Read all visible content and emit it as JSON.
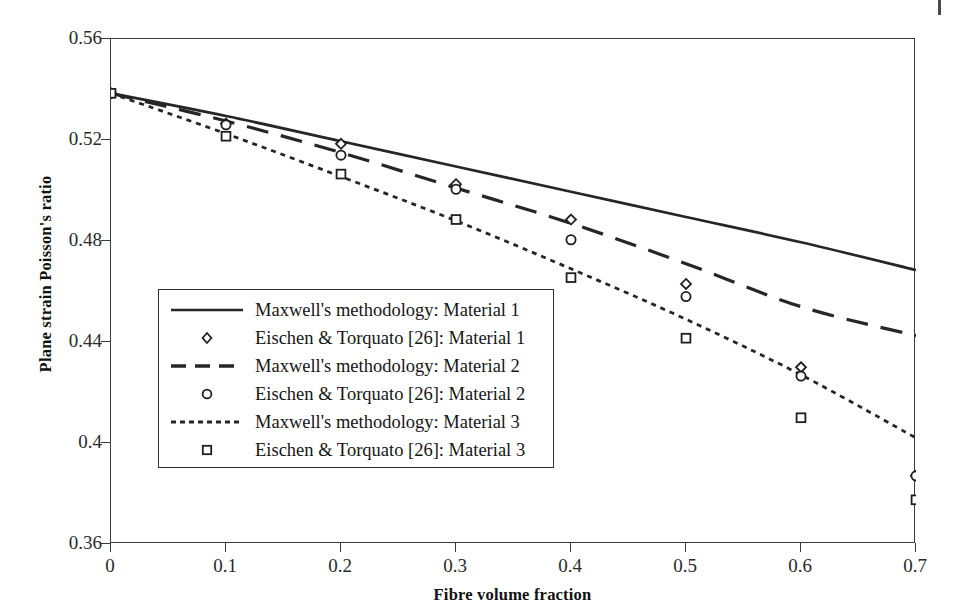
{
  "chart_data": {
    "type": "line",
    "title": "",
    "xlabel": "Fibre volume fraction",
    "ylabel": "Plane strain Poisson's ratio",
    "xlim": [
      0,
      0.7
    ],
    "ylim": [
      0.36,
      0.56
    ],
    "xticks": [
      "0",
      "0.1",
      "0.2",
      "0.3",
      "0.4",
      "0.5",
      "0.6",
      "0.7"
    ],
    "xtick_values": [
      0,
      0.1,
      0.2,
      0.3,
      0.4,
      0.5,
      0.6,
      0.7
    ],
    "yticks": [
      "0.56",
      "0.52",
      "0.48",
      "0.44",
      "0.4",
      "0.36"
    ],
    "ytick_values": [
      0.56,
      0.52,
      0.48,
      0.44,
      0.4,
      0.36
    ],
    "grid": false,
    "legend_position": "inside-left-lower",
    "series": [
      {
        "name": "Maxwell's methodology: Material 1",
        "style": "solid",
        "marker": "none",
        "x": [
          0,
          0.1,
          0.2,
          0.3,
          0.4,
          0.5,
          0.6,
          0.7
        ],
        "values": [
          0.5385,
          0.5295,
          0.5195,
          0.5095,
          0.4995,
          0.4895,
          0.4795,
          0.4685
        ]
      },
      {
        "name": "Eischen & Torquato [26]: Material 1",
        "style": "markers",
        "marker": "diamond",
        "x": [
          0,
          0.1,
          0.2,
          0.3,
          0.4,
          0.5,
          0.6,
          0.7
        ],
        "values": [
          0.5385,
          0.5265,
          0.5185,
          0.5025,
          0.4885,
          0.463,
          0.43,
          0.387
        ]
      },
      {
        "name": "Maxwell's methodology: Material 2",
        "style": "dashed",
        "marker": "none",
        "x": [
          0,
          0.1,
          0.2,
          0.3,
          0.4,
          0.5,
          0.6,
          0.7
        ],
        "values": [
          0.5385,
          0.5275,
          0.515,
          0.501,
          0.487,
          0.471,
          0.454,
          0.4425
        ]
      },
      {
        "name": "Eischen & Torquato [26]: Material 2",
        "style": "markers",
        "marker": "circle",
        "x": [
          0,
          0.1,
          0.2,
          0.3,
          0.4,
          0.5,
          0.6,
          0.7
        ],
        "values": [
          0.5385,
          0.526,
          0.514,
          0.5005,
          0.4805,
          0.458,
          0.4265,
          0.387
        ]
      },
      {
        "name": "Maxwell's methodology: Material 3",
        "style": "dotted",
        "marker": "none",
        "x": [
          0,
          0.1,
          0.2,
          0.3,
          0.4,
          0.5,
          0.6,
          0.7
        ],
        "values": [
          0.5385,
          0.5225,
          0.5055,
          0.488,
          0.469,
          0.449,
          0.427,
          0.402
        ]
      },
      {
        "name": "Eischen & Torquato [26]: Material 3",
        "style": "markers",
        "marker": "square",
        "x": [
          0,
          0.1,
          0.2,
          0.3,
          0.4,
          0.5,
          0.6,
          0.7
        ],
        "values": [
          0.5385,
          0.5215,
          0.5065,
          0.4885,
          0.4655,
          0.4415,
          0.41,
          0.3775
        ]
      }
    ],
    "legend_entries": [
      {
        "label": "Maxwell's methodology: Material 1",
        "key": "solid-line"
      },
      {
        "label": "Eischen & Torquato [26]: Material 1",
        "key": "diamond-marker"
      },
      {
        "label": "Maxwell's methodology: Material 2",
        "key": "dashed-line"
      },
      {
        "label": "Eischen & Torquato [26]: Material 2",
        "key": "circle-marker"
      },
      {
        "label": "Maxwell's methodology: Material 3",
        "key": "dotted-line"
      },
      {
        "label": "Eischen & Torquato [26]: Material 3",
        "key": "square-marker"
      }
    ],
    "colors": {
      "line": "#262626",
      "marker": "#1f1f1f",
      "axis": "#3a3a3a",
      "text": "#151515"
    }
  }
}
